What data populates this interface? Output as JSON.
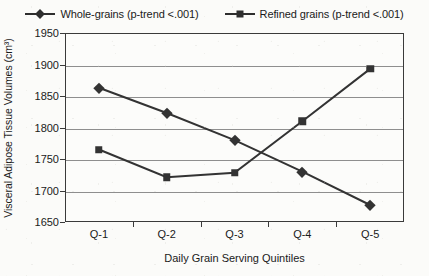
{
  "chart_data": {
    "type": "line",
    "title": "",
    "xlabel": "Daily Grain Serving Quintiles",
    "ylabel": "Visceral Adipose Tissue Volumes (cm³)",
    "categories": [
      "Q-1",
      "Q-2",
      "Q-3",
      "Q-4",
      "Q-5"
    ],
    "ylim": [
      1650,
      1950
    ],
    "yticks": [
      1650,
      1700,
      1750,
      1800,
      1850,
      1900,
      1950
    ],
    "ytick_labels": [
      "1650",
      "1700",
      "1750",
      "1800",
      "1850",
      "1900",
      "1950"
    ],
    "grid": true,
    "legend_position": "top-center",
    "series": [
      {
        "name": "Whole-grains (p-trend <.001)",
        "marker": "diamond",
        "color": "#333333",
        "values": [
          1863,
          1823,
          1780,
          1730,
          1677
        ]
      },
      {
        "name": "Refined grains (p-trend <.001)",
        "marker": "square",
        "color": "#333333",
        "values": [
          1765,
          1721,
          1728,
          1810,
          1893
        ]
      }
    ]
  },
  "legend": {
    "entries": [
      {
        "label": "Whole-grains (p-trend <.001)",
        "marker": "diamond"
      },
      {
        "label": "Refined grains (p-trend <.001)",
        "marker": "square"
      }
    ]
  },
  "axes": {
    "y_title": "Visceral Adipose Tissue Volumes (cm³)",
    "x_title": "Daily Grain Serving Quintiles"
  }
}
